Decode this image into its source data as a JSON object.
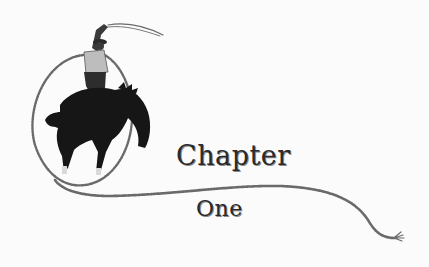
{
  "chapter": {
    "word": "Chapter",
    "number": "One"
  },
  "illustration": {
    "subject": "cowboy-on-bucking-horse-with-lasso",
    "colors": {
      "horse": "#1a1a1a",
      "rope": "#6e6e6e",
      "background": "#fbfbfb"
    }
  }
}
